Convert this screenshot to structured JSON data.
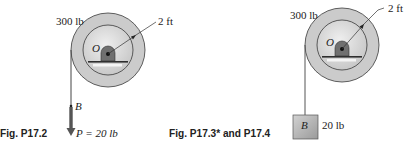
{
  "figure_left": {
    "caption": "Fig. P17.2",
    "pulley_weight": "300 lb",
    "radius_label": "2 ft",
    "center_label": "O",
    "point_label": "B",
    "force_label": "P = 20 lb"
  },
  "figure_right": {
    "caption": "Fig. P17.3* and P17.4",
    "pulley_weight": "300 lb",
    "radius_label": "2 ft",
    "center_label": "O",
    "block_label": "B",
    "block_weight": "20 lb"
  },
  "colors": {
    "outer_ring": "#c9c9c9",
    "inner_disk": "#dcdcdc",
    "hub": "#6f6f6f",
    "stroke": "#3a3a3a",
    "block": "#b3b3b3",
    "arrow": "#555555"
  }
}
